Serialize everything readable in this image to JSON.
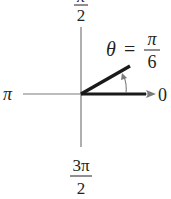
{
  "diagram": {
    "type": "polar-angle",
    "labels": {
      "top": {
        "num": "π",
        "den": "2"
      },
      "left": "π",
      "right": "0",
      "bottom": {
        "num": "3π",
        "den": "2"
      }
    },
    "angle": {
      "symbol": "θ",
      "equals": "=",
      "num": "π",
      "den": "6",
      "degrees": 30
    },
    "colors": {
      "axis": "#7a7a7a",
      "ray": "#1a1a1a",
      "text": "#231f20"
    }
  }
}
